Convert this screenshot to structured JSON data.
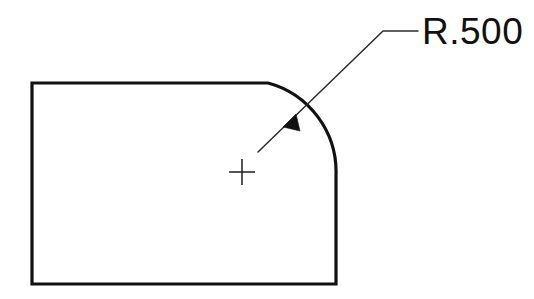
{
  "drawing": {
    "title": "Radius callout detail",
    "background_color": "#ffffff",
    "line_color": "#111111",
    "leader_color": "#2b2b2b",
    "canvas": {
      "width": 534,
      "height": 299
    },
    "dimension": {
      "label": "R.500",
      "symbol": "R",
      "value": ".500",
      "text_x": 422,
      "text_baseline_y": 44,
      "font_size_px": 37
    },
    "part": {
      "name": "rounded-corner-plate",
      "left_x": 32,
      "top_y": 83,
      "right_x": 336,
      "bottom_y": 284,
      "corner": "top-right",
      "corner_radius_px": 92,
      "arc_start_x": 268,
      "arc_end_y": 175,
      "stroke_width": 3.2,
      "path": "M 32 83 L 268 83 A 92 92 0 0 1 336 175 L 336 284 L 32 284 Z"
    },
    "center_mark": {
      "center_x": 242,
      "center_y": 172,
      "arm_length_px": 13
    },
    "leader": {
      "tail_x": 258,
      "tail_y": 152,
      "arrow_tip_x": 283,
      "arrow_tip_y": 127,
      "elbow_x": 383,
      "elbow_y": 31,
      "shelf_end_x": 418,
      "shelf_end_y": 31,
      "stroke_width": 1.5,
      "arrow_points": "283,127 300,131 296,114",
      "path": "M 258 152 L 383 31 L 418 31"
    }
  }
}
